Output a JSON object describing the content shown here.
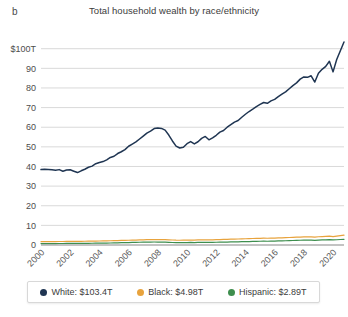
{
  "panel": {
    "label": "b"
  },
  "header": {
    "title": "Total household wealth by race/ethnicity"
  },
  "colors": {
    "white_series": "#1F3552",
    "black_series": "#E8A33D",
    "hispanic_series": "#3E8E4E",
    "grid": "#d9d9d9",
    "axis": "#9a9a9a",
    "text": "#3c3c3c"
  },
  "legend": {
    "items": [
      {
        "name": "white",
        "label": "White: $103.4T",
        "color": "#1F3552"
      },
      {
        "name": "black",
        "label": "Black: $4.98T",
        "color": "#E8A33D"
      },
      {
        "name": "hispanic",
        "label": "Hispanic: $2.89T",
        "color": "#3E8E4E"
      }
    ]
  },
  "axes": {
    "y_ticks": [
      "$100T",
      "90",
      "80",
      "70",
      "60",
      "50",
      "40",
      "30",
      "20",
      "10",
      "0"
    ],
    "x_ticks": [
      "2000",
      "2002",
      "2004",
      "2006",
      "2008",
      "2010",
      "2012",
      "2014",
      "2016",
      "2018",
      "2020"
    ]
  },
  "chart_data": {
    "type": "line",
    "title": "Total household wealth by race/ethnicity",
    "xlabel": "",
    "ylabel": "",
    "ylim": [
      0,
      108
    ],
    "xlim": [
      2000,
      2020.75
    ],
    "grid": true,
    "legend_position": "bottom",
    "y_tick_values": [
      0,
      10,
      20,
      30,
      40,
      50,
      60,
      70,
      80,
      90,
      100
    ],
    "y_tick_labels": [
      "0",
      "10",
      "20",
      "30",
      "40",
      "50",
      "60",
      "70",
      "80",
      "90",
      "$100T"
    ],
    "x_tick_values": [
      2000,
      2002,
      2004,
      2006,
      2008,
      2010,
      2012,
      2014,
      2016,
      2018,
      2020
    ],
    "x_tick_labels": [
      "2000",
      "2002",
      "2004",
      "2006",
      "2008",
      "2010",
      "2012",
      "2014",
      "2016",
      "2018",
      "2020"
    ],
    "units": "trillions of USD",
    "x": [
      2000.0,
      2000.25,
      2000.5,
      2000.75,
      2001.0,
      2001.25,
      2001.5,
      2001.75,
      2002.0,
      2002.25,
      2002.5,
      2002.75,
      2003.0,
      2003.25,
      2003.5,
      2003.75,
      2004.0,
      2004.25,
      2004.5,
      2004.75,
      2005.0,
      2005.25,
      2005.5,
      2005.75,
      2006.0,
      2006.25,
      2006.5,
      2006.75,
      2007.0,
      2007.25,
      2007.5,
      2007.75,
      2008.0,
      2008.25,
      2008.5,
      2008.75,
      2009.0,
      2009.25,
      2009.5,
      2009.75,
      2010.0,
      2010.25,
      2010.5,
      2010.75,
      2011.0,
      2011.25,
      2011.5,
      2011.75,
      2012.0,
      2012.25,
      2012.5,
      2012.75,
      2013.0,
      2013.25,
      2013.5,
      2013.75,
      2014.0,
      2014.25,
      2014.5,
      2014.75,
      2015.0,
      2015.25,
      2015.5,
      2015.75,
      2016.0,
      2016.25,
      2016.5,
      2016.75,
      2017.0,
      2017.25,
      2017.5,
      2017.75,
      2018.0,
      2018.25,
      2018.5,
      2018.75,
      2019.0,
      2019.25,
      2019.5,
      2019.75,
      2020.0,
      2020.25,
      2020.5,
      2020.75
    ],
    "series": [
      {
        "name": "White",
        "color": "#1F3552",
        "end_label": "$103.4T",
        "values": [
          38.4,
          38.6,
          38.5,
          38.3,
          38.1,
          38.4,
          37.6,
          38.2,
          38.3,
          37.6,
          36.9,
          37.8,
          38.6,
          39.6,
          40.2,
          41.4,
          42.0,
          42.5,
          43.4,
          44.6,
          45.2,
          46.6,
          47.5,
          48.6,
          50.3,
          51.4,
          52.5,
          54.0,
          55.5,
          57.0,
          58.0,
          59.3,
          59.6,
          59.4,
          58.5,
          56.0,
          53.0,
          50.4,
          49.4,
          49.8,
          51.6,
          52.7,
          51.5,
          52.6,
          54.3,
          55.3,
          53.6,
          54.6,
          55.9,
          57.5,
          58.3,
          60.0,
          61.3,
          62.6,
          63.4,
          65.1,
          66.6,
          68.0,
          69.2,
          70.5,
          71.6,
          72.6,
          72.2,
          73.4,
          74.2,
          75.6,
          76.9,
          78.0,
          79.6,
          81.2,
          82.6,
          84.5,
          85.6,
          85.4,
          86.2,
          83.0,
          87.5,
          89.5,
          91.0,
          93.6,
          88.2,
          94.5,
          99.0,
          103.4
        ]
      },
      {
        "name": "Black",
        "color": "#E8A33D",
        "end_label": "$4.98T",
        "values": [
          1.72,
          1.74,
          1.75,
          1.76,
          1.77,
          1.79,
          1.78,
          1.82,
          1.84,
          1.83,
          1.81,
          1.86,
          1.9,
          1.94,
          1.97,
          2.02,
          2.05,
          2.08,
          2.12,
          2.17,
          2.21,
          2.27,
          2.31,
          2.36,
          2.42,
          2.47,
          2.52,
          2.58,
          2.63,
          2.69,
          2.73,
          2.77,
          2.78,
          2.76,
          2.72,
          2.64,
          2.54,
          2.46,
          2.43,
          2.45,
          2.51,
          2.55,
          2.51,
          2.56,
          2.62,
          2.66,
          2.6,
          2.65,
          2.71,
          2.78,
          2.82,
          2.89,
          2.95,
          3.01,
          3.05,
          3.12,
          3.19,
          3.25,
          3.31,
          3.37,
          3.42,
          3.47,
          3.45,
          3.51,
          3.55,
          3.62,
          3.68,
          3.74,
          3.82,
          3.9,
          3.97,
          4.05,
          4.11,
          4.1,
          4.14,
          4.01,
          4.21,
          4.31,
          4.39,
          4.51,
          4.29,
          4.55,
          4.78,
          4.98
        ]
      },
      {
        "name": "Hispanic",
        "color": "#3E8E4E",
        "end_label": "$2.89T",
        "values": [
          0.72,
          0.73,
          0.74,
          0.74,
          0.75,
          0.76,
          0.76,
          0.78,
          0.79,
          0.79,
          0.78,
          0.81,
          0.83,
          0.86,
          0.88,
          0.91,
          0.93,
          0.96,
          0.99,
          1.03,
          1.07,
          1.12,
          1.16,
          1.21,
          1.26,
          1.31,
          1.35,
          1.4,
          1.44,
          1.48,
          1.5,
          1.52,
          1.51,
          1.48,
          1.44,
          1.36,
          1.28,
          1.22,
          1.2,
          1.22,
          1.26,
          1.29,
          1.26,
          1.29,
          1.33,
          1.36,
          1.32,
          1.35,
          1.39,
          1.43,
          1.46,
          1.51,
          1.55,
          1.59,
          1.62,
          1.67,
          1.72,
          1.77,
          1.81,
          1.86,
          1.9,
          1.94,
          1.92,
          1.97,
          2.01,
          2.07,
          2.12,
          2.17,
          2.23,
          2.29,
          2.34,
          2.41,
          2.45,
          2.44,
          2.48,
          2.37,
          2.52,
          2.6,
          2.66,
          2.75,
          2.56,
          2.68,
          2.8,
          2.89
        ]
      }
    ]
  }
}
